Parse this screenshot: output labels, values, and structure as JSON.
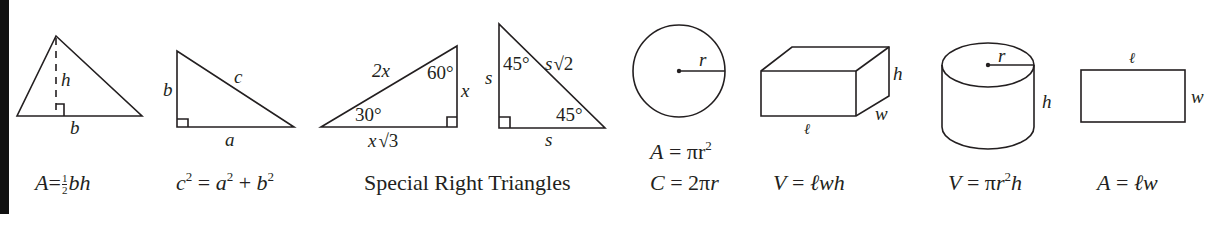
{
  "sheet": {
    "title": "Reference Formulas",
    "figures": [
      {
        "id": "triangle",
        "labels": [
          "h",
          "b"
        ],
        "formula": "A = ½bh",
        "formula_parts": {
          "lhs": "A",
          "frac_num": "1",
          "frac_den": "2",
          "rhs": "bh"
        }
      },
      {
        "id": "right-triangle",
        "labels": [
          "b",
          "c",
          "a"
        ],
        "formula": "c² = a² + b²",
        "formula_parts": {
          "c": "c",
          "a": "a",
          "b": "b",
          "exp": "2"
        }
      },
      {
        "id": "special-30-60-90",
        "labels": [
          "2x",
          "60°",
          "x",
          "30°",
          "x√3"
        ]
      },
      {
        "id": "special-45-45-90",
        "labels": [
          "s",
          "45°",
          "s√2",
          "45°",
          "s"
        ]
      },
      {
        "id": "circle",
        "labels": [
          "r"
        ],
        "formulas": [
          "A = πr²",
          "C = 2πr"
        ]
      },
      {
        "id": "rectangular-box",
        "labels": [
          "h",
          "w",
          "ℓ"
        ],
        "formula": "V = ℓwh"
      },
      {
        "id": "cylinder",
        "labels": [
          "r",
          "h"
        ],
        "formula": "V = πr²h"
      },
      {
        "id": "rectangle",
        "labels": [
          "ℓ",
          "w"
        ],
        "formula": "A = ℓw"
      }
    ],
    "special_caption": "Special Right Triangles",
    "text": {
      "tri_h": "h",
      "tri_b": "b",
      "rt_b": "b",
      "rt_c": "c",
      "rt_a": "a",
      "s30_hyp": "2x",
      "s30_60": "60°",
      "s30_x": "x",
      "s30_30": "30°",
      "s30_base_x": "x",
      "s30_base_root": "√3",
      "s45_s_left": "s",
      "s45_45top": "45°",
      "s45_hyp_s": "s",
      "s45_hyp_root": "√2",
      "s45_45bot": "45°",
      "s45_s_bottom": "s",
      "circle_r": "r",
      "box_h": "h",
      "box_w": "w",
      "box_l": "ℓ",
      "cyl_r": "r",
      "cyl_h": "h",
      "rect_l": "ℓ",
      "rect_w": "w",
      "f_tri_A": "A",
      "f_tri_eq": "=",
      "f_tri_num": "1",
      "f_tri_den": "2",
      "f_tri_bh": "bh",
      "f_py_c": "c",
      "f_py_exp": "2",
      "f_py_eq": " = ",
      "f_py_a": "a",
      "f_py_plus": " + ",
      "f_py_b": "b",
      "f_circ_area_lhs": "A",
      "f_circ_area_mid": " = πr",
      "f_circ_area_exp": "2",
      "f_circ_c_lhs": "C",
      "f_circ_c_mid": " = 2π",
      "f_circ_c_r": "r",
      "f_box_V": "V",
      "f_box_eq": " = ",
      "f_box_rhs": "ℓwh",
      "f_cyl_V": "V",
      "f_cyl_eq": " = π",
      "f_cyl_r": "r",
      "f_cyl_exp": "2",
      "f_cyl_h": "h",
      "f_rect_A": "A",
      "f_rect_eq": " = ",
      "f_rect_rhs": "ℓw"
    }
  }
}
